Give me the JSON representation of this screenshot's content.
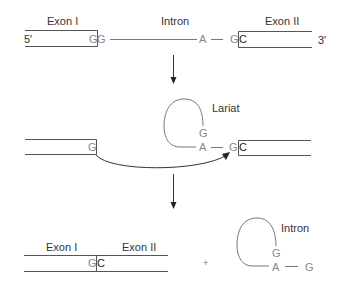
{
  "diagram": {
    "type": "rna-splicing-schematic",
    "stage1": {
      "exon1_label": "Exon I",
      "intron_label": "Intron",
      "exon2_label": "Exon II",
      "five_prime": "5′",
      "three_prime": "3′",
      "exon1_end_nuc": "G",
      "intron_start_nuc": "G",
      "branch_point_nuc": "A",
      "intron_end_nuc": "G",
      "exon2_start_nuc": "C"
    },
    "stage2": {
      "lariat_label": "Lariat",
      "exon1_end_nuc": "G",
      "lariat_g": "G",
      "lariat_a": "A",
      "intron_end_nuc": "G",
      "exon2_start_nuc": "C"
    },
    "stage3": {
      "exon1_label": "Exon I",
      "exon2_label": "Exon II",
      "junction_g": "G",
      "junction_c": "C",
      "plus_sign": "+",
      "intron_label": "Intron",
      "lariat_g": "G",
      "lariat_a": "A",
      "tail_g": "G"
    },
    "colors": {
      "text": "#333333",
      "nucleotide": "#888888",
      "line": "#777777",
      "arrow": "#222222",
      "background": "#ffffff"
    }
  }
}
